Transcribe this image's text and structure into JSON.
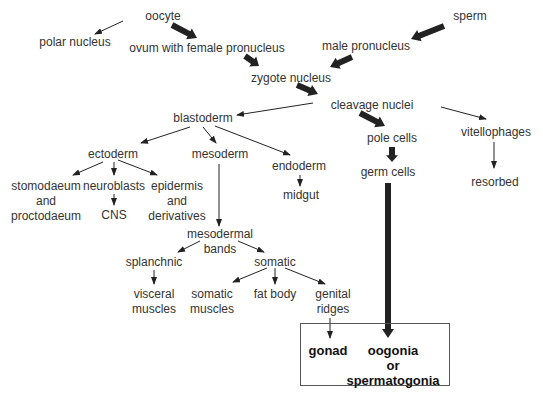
{
  "diagram": {
    "title": "",
    "nodes": {
      "oocyte": "oocyte",
      "sperm": "sperm",
      "polar_nucleus": "polar nucleus",
      "ovum": "ovum with female pronucleus",
      "male_pronucleus": "male pronucleus",
      "zygote": "zygote nucleus",
      "cleavage": "cleavage nuclei",
      "blastoderm": "blastoderm",
      "pole_cells": "pole cells",
      "vitellophages": "vitellophages",
      "germ_cells": "germ cells",
      "resorbed": "resorbed",
      "ectoderm": "ectoderm",
      "mesoderm": "mesoderm",
      "endoderm": "endoderm",
      "midgut": "midgut",
      "stomodaeum": "stomodaeum\nand\nproctodaeum",
      "neuroblasts": "neuroblasts",
      "cns": "CNS",
      "epidermis": "epidermis\nand\nderivatives",
      "mesodermal_bands": "mesodermal\nbands",
      "splanchnic": "splanchnic",
      "somatic": "somatic",
      "visceral_muscles": "visceral\nmuscles",
      "somatic_muscles": "somatic\nmuscles",
      "fat_body": "fat body",
      "genital_ridges": "genital\nridges",
      "gonad": "gonad",
      "oogonia": "oogonia\nor\nspermatogonia"
    },
    "edges": [
      {
        "from": "oocyte",
        "to": "polar_nucleus",
        "weight": "thin"
      },
      {
        "from": "oocyte",
        "to": "ovum",
        "weight": "thick"
      },
      {
        "from": "sperm",
        "to": "male_pronucleus",
        "weight": "thick"
      },
      {
        "from": "ovum",
        "to": "zygote",
        "weight": "thick"
      },
      {
        "from": "male_pronucleus",
        "to": "zygote",
        "weight": "thick"
      },
      {
        "from": "zygote",
        "to": "cleavage",
        "weight": "thick"
      },
      {
        "from": "cleavage",
        "to": "blastoderm",
        "weight": "thin"
      },
      {
        "from": "cleavage",
        "to": "pole_cells",
        "weight": "thick"
      },
      {
        "from": "cleavage",
        "to": "vitellophages",
        "weight": "thin"
      },
      {
        "from": "pole_cells",
        "to": "germ_cells",
        "weight": "thick"
      },
      {
        "from": "vitellophages",
        "to": "resorbed",
        "weight": "thin"
      },
      {
        "from": "blastoderm",
        "to": "ectoderm",
        "weight": "thin"
      },
      {
        "from": "blastoderm",
        "to": "mesoderm",
        "weight": "thin"
      },
      {
        "from": "blastoderm",
        "to": "endoderm",
        "weight": "thin"
      },
      {
        "from": "endoderm",
        "to": "midgut",
        "weight": "thin"
      },
      {
        "from": "ectoderm",
        "to": "stomodaeum",
        "weight": "thin"
      },
      {
        "from": "ectoderm",
        "to": "neuroblasts",
        "weight": "thin"
      },
      {
        "from": "ectoderm",
        "to": "epidermis",
        "weight": "thin"
      },
      {
        "from": "neuroblasts",
        "to": "cns",
        "weight": "thin"
      },
      {
        "from": "mesoderm",
        "to": "mesodermal_bands",
        "weight": "thin"
      },
      {
        "from": "mesodermal_bands",
        "to": "splanchnic",
        "weight": "thin"
      },
      {
        "from": "mesodermal_bands",
        "to": "somatic",
        "weight": "thin"
      },
      {
        "from": "splanchnic",
        "to": "visceral_muscles",
        "weight": "thin"
      },
      {
        "from": "somatic",
        "to": "somatic_muscles",
        "weight": "thin"
      },
      {
        "from": "somatic",
        "to": "fat_body",
        "weight": "thin"
      },
      {
        "from": "somatic",
        "to": "genital_ridges",
        "weight": "thin"
      },
      {
        "from": "genital_ridges",
        "to": "gonad",
        "weight": "thin"
      },
      {
        "from": "germ_cells",
        "to": "oogonia",
        "weight": "thick"
      }
    ],
    "colors": {
      "ink": "#222222",
      "text": "#333333",
      "background": "#ffffff"
    }
  }
}
